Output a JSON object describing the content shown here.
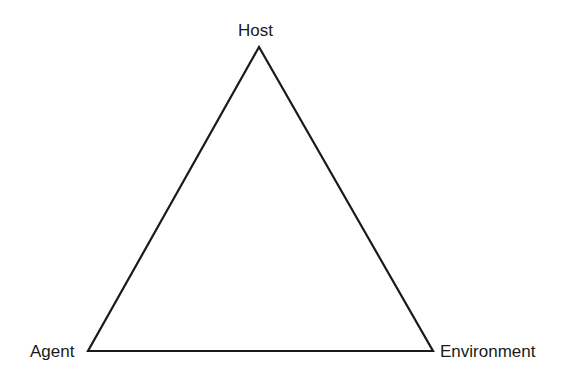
{
  "diagram": {
    "type": "triangle",
    "nodes": [
      {
        "id": "host",
        "label": "Host",
        "x": 259,
        "y": 47
      },
      {
        "id": "agent",
        "label": "Agent",
        "x": 88,
        "y": 351
      },
      {
        "id": "environment",
        "label": "Environment",
        "x": 433,
        "y": 351
      }
    ],
    "edges": [
      {
        "from": "host",
        "to": "agent"
      },
      {
        "from": "host",
        "to": "environment"
      },
      {
        "from": "agent",
        "to": "environment"
      }
    ],
    "stroke_color": "#1a1a1a"
  }
}
